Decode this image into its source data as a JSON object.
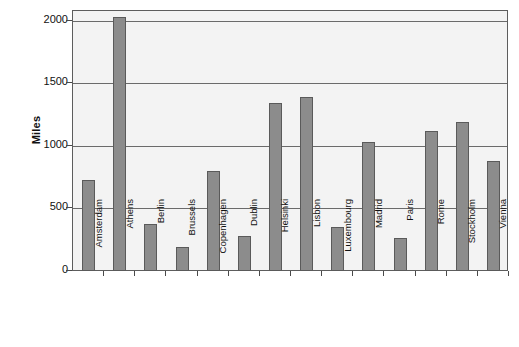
{
  "chart_data": {
    "type": "bar",
    "title": "",
    "subtitle": "",
    "xlabel": "",
    "ylabel": "Miles",
    "ylim": [
      0,
      2100
    ],
    "yticks": [
      0,
      500,
      1000,
      1500,
      2000
    ],
    "ytick_labels": [
      "0",
      "500",
      "1000",
      "1500",
      "2000"
    ],
    "grid": true,
    "legend": "none",
    "bar_color": "#8c8c8c",
    "bar_border_color": "#5a5a5a",
    "plot_background": "#f3f3f3",
    "axis_color": "#5d5d5d",
    "categories": [
      "Amsterdam",
      "Athens",
      "Berlin",
      "Brussels",
      "Copenhagen",
      "Dublin",
      "Helsinki",
      "Lisbon",
      "Luxembourg",
      "Madrid",
      "Paris",
      "Rome",
      "Stockholm",
      "Vienna"
    ],
    "values": [
      730,
      2030,
      375,
      195,
      800,
      280,
      1340,
      1390,
      350,
      1030,
      265,
      1120,
      1190,
      880
    ]
  }
}
